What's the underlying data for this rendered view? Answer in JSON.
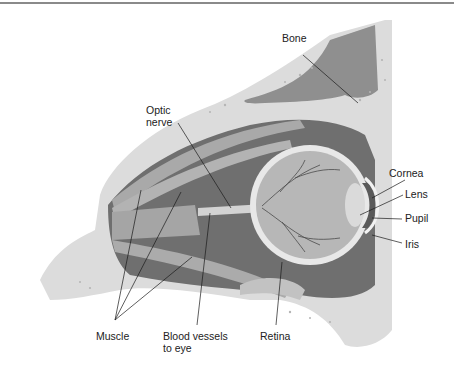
{
  "figure": {
    "labels": {
      "bone": "Bone",
      "optic_nerve_1": "Optic",
      "optic_nerve_2": "nerve",
      "cornea": "Cornea",
      "lens": "Lens",
      "pupil": "Pupil",
      "iris": "Iris",
      "muscle": "Muscle",
      "blood_vessels_1": "Blood vessels",
      "blood_vessels_2": "to eye",
      "retina": "Retina"
    },
    "colors": {
      "bone": "#d9d9d9",
      "bone_dark": "#bdbdbd",
      "cavity": "#8c8c8c",
      "orbit_dark": "#6e6e6e",
      "muscle": "#a8a8a8",
      "eyeball": "#b8b8b8",
      "sclera": "#e6e6e6",
      "leader": "#1a1a1a"
    }
  }
}
